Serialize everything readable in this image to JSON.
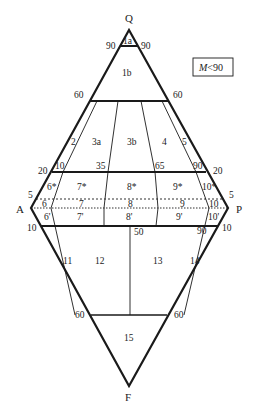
{
  "diagram": {
    "type": "QAPF double-triangle classification diagram",
    "vertices": {
      "Q": "Q",
      "A": "A",
      "P": "P",
      "F": "F"
    },
    "legend": {
      "text_italic": "M",
      "text_rest": "<90"
    },
    "side_ticks": {
      "top_90_left": "90",
      "top_90_right": "90",
      "top_60_left": "60",
      "top_60_right": "60",
      "top_20_left": "20",
      "top_20_right": "20",
      "mid_5_left": "5",
      "mid_5_right": "5",
      "bot_10_left": "10",
      "bot_10_right": "10",
      "bot_60_left": "60",
      "bot_60_right": "60"
    },
    "internal_ticks": {
      "t10": "10",
      "t35": "35",
      "t65": "65",
      "t90": "90",
      "b50": "50",
      "b90": "90"
    },
    "fields": {
      "f1a": "1a",
      "f1b": "1b",
      "f2": "2",
      "f3a": "3a",
      "f3b": "3b",
      "f4": "4",
      "f5": "5",
      "f6s": "6*",
      "f7s": "7*",
      "f8s": "8*",
      "f9s": "9*",
      "f10s": "10*",
      "f6": "6",
      "f7": "7",
      "f8": "8",
      "f9": "9",
      "f10": "10",
      "f6p": "6'",
      "f7p": "7'",
      "f8p": "8'",
      "f9p": "9'",
      "f10p": "10'",
      "f11": "11",
      "f12": "12",
      "f13": "13",
      "f14": "14",
      "f15": "15"
    },
    "colors": {
      "line": "#1a1a1a",
      "text": "#222222",
      "background": "#ffffff"
    }
  }
}
